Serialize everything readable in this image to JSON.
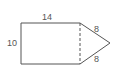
{
  "diagram": {
    "stroke_color": "#555555",
    "labels": {
      "top": "14",
      "left": "10",
      "triangle_upper": "8",
      "triangle_lower": "8"
    },
    "shapes": {
      "rectangle": {
        "width": 14,
        "height": 10
      },
      "triangle": {
        "side_a": 8,
        "side_b": 8,
        "base": 10
      }
    }
  }
}
